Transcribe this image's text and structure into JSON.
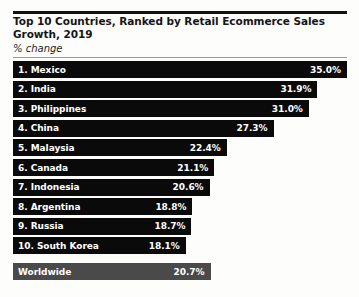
{
  "chart_data": {
    "type": "bar",
    "title": "Top 10 Countries, Ranked by Retail Ecommerce Sales Growth, 2019",
    "subtitle": "% change",
    "xlabel": "",
    "ylabel": "",
    "grid": false,
    "legend": "none",
    "orientation": "horizontal",
    "xlim": [
      0,
      35.0
    ],
    "categories": [
      "1. Mexico",
      "2. India",
      "3. Philippines",
      "4. China",
      "5. Malaysia",
      "6. Canada",
      "7. Indonesia",
      "8. Argentina",
      "9. Russia",
      "10. South Korea",
      "Worldwide"
    ],
    "values": [
      35.0,
      31.9,
      31.0,
      27.3,
      22.4,
      21.1,
      20.6,
      18.8,
      18.7,
      18.1,
      20.7
    ],
    "value_labels": [
      "35.0%",
      "31.9%",
      "31.0%",
      "27.3%",
      "22.4%",
      "21.1%",
      "20.6%",
      "18.8%",
      "18.7%",
      "18.1%",
      "20.7%"
    ],
    "bar_colors": [
      "#0a0a0a",
      "#0a0a0a",
      "#0a0a0a",
      "#0a0a0a",
      "#0a0a0a",
      "#0a0a0a",
      "#0a0a0a",
      "#0a0a0a",
      "#0a0a0a",
      "#0a0a0a",
      "#4a4a4a"
    ]
  },
  "rows": [
    {
      "label": "1. Mexico",
      "value_label": "35.0%"
    },
    {
      "label": "2. India",
      "value_label": "31.9%"
    },
    {
      "label": "3. Philippines",
      "value_label": "31.0%"
    },
    {
      "label": "4. China",
      "value_label": "27.3%"
    },
    {
      "label": "5. Malaysia",
      "value_label": "22.4%"
    },
    {
      "label": "6. Canada",
      "value_label": "21.1%"
    },
    {
      "label": "7. Indonesia",
      "value_label": "20.6%"
    },
    {
      "label": "8. Argentina",
      "value_label": "18.8%"
    },
    {
      "label": "9. Russia",
      "value_label": "18.7%"
    },
    {
      "label": "10. South Korea",
      "value_label": "18.1%"
    },
    {
      "label": "Worldwide",
      "value_label": "20.7%"
    }
  ]
}
